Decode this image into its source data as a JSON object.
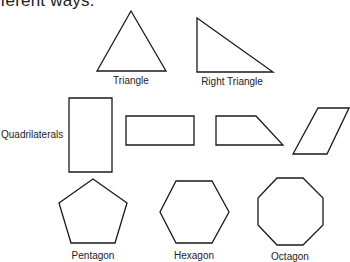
{
  "heading": "fferent ways.",
  "group_label": "Quadrilaterals",
  "shapes": [
    {
      "name": "Triangle",
      "label": "Triangle",
      "points": "131,11 166,71 97,71",
      "label_x": 131,
      "label_y": 74
    },
    {
      "name": "Right Triangle",
      "label": "Right Triangle",
      "points": "197,18 273,72 197,72",
      "label_x": 232,
      "label_y": 76
    },
    {
      "name": "Tall Rectangle",
      "label": "",
      "points": "69,98 112,98 112,172 69,172"
    },
    {
      "name": "Wide Rectangle",
      "label": "",
      "points": "126,116 194,116 194,145 126,145"
    },
    {
      "name": "Trapezoid",
      "label": "",
      "points": "216,116 256,116 283,145 216,145"
    },
    {
      "name": "Parallelogram",
      "label": "",
      "points": "318,108 349,108 327,154 293,154"
    },
    {
      "name": "Pentagon",
      "label": "Pentagon",
      "points": "93,179 127,203 115,243 71,243 59,203",
      "label_x": 93,
      "label_y": 250
    },
    {
      "name": "Hexagon",
      "label": "Hexagon",
      "points": "176,181 212,181 229,212 212,243 176,243 160,212",
      "label_x": 194,
      "label_y": 250
    },
    {
      "name": "Octagon",
      "label": "Octagon",
      "points": "277,178 303,178 323,198 323,225 303,245 277,245 258,225 258,198",
      "label_x": 290,
      "label_y": 251
    }
  ],
  "style": {
    "stroke": "#1a1a1a",
    "background": "#ffffff",
    "text": "#222222"
  }
}
